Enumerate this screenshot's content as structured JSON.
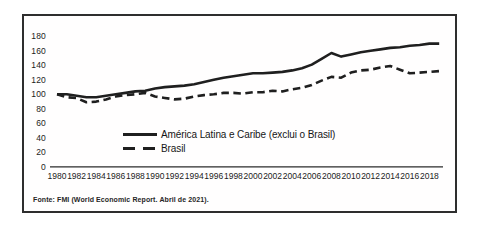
{
  "chart_data": {
    "type": "line",
    "title": "",
    "xlabel": "",
    "ylabel": "",
    "x": [
      1980,
      1981,
      1982,
      1983,
      1984,
      1985,
      1986,
      1987,
      1988,
      1989,
      1990,
      1991,
      1992,
      1993,
      1994,
      1995,
      1996,
      1997,
      1998,
      1999,
      2000,
      2001,
      2002,
      2003,
      2004,
      2005,
      2006,
      2007,
      2008,
      2009,
      2010,
      2011,
      2012,
      2013,
      2014,
      2015,
      2016,
      2017,
      2018,
      2019
    ],
    "series": [
      {
        "name": "América Latina e Caribe (exclui o Brasil)",
        "style": "solid",
        "values": [
          100,
          100,
          98,
          96,
          96,
          98,
          100,
          102,
          104,
          105,
          108,
          110,
          111,
          112,
          114,
          117,
          120,
          123,
          125,
          127,
          129,
          129,
          130,
          131,
          133,
          136,
          141,
          149,
          157,
          152,
          155,
          158,
          160,
          162,
          164,
          165,
          167,
          168,
          170,
          170
        ]
      },
      {
        "name": "Brasil",
        "style": "dashed",
        "values": [
          100,
          96,
          95,
          89,
          90,
          93,
          97,
          99,
          100,
          102,
          97,
          95,
          93,
          94,
          97,
          99,
          100,
          102,
          102,
          101,
          103,
          103,
          105,
          104,
          107,
          109,
          113,
          119,
          124,
          123,
          130,
          133,
          134,
          137,
          139,
          134,
          129,
          130,
          131,
          132
        ]
      }
    ],
    "ylim": [
      0,
      180
    ],
    "y_ticks": [
      0,
      20,
      40,
      60,
      80,
      100,
      120,
      140,
      160,
      180
    ],
    "x_tick_labels": [
      "1980",
      "1982",
      "1984",
      "1986",
      "1988",
      "1990",
      "1992",
      "1994",
      "1996",
      "1998",
      "2000",
      "2002",
      "2004",
      "2006",
      "2008",
      "2010",
      "2012",
      "2014",
      "2016",
      "2018"
    ],
    "grid": false,
    "legend_position": "inside-bottom-center",
    "line_color": "#1f1f1f"
  },
  "footer": {
    "source_note": "Fonte: FMI (World Economic Report. Abril de 2021)."
  }
}
